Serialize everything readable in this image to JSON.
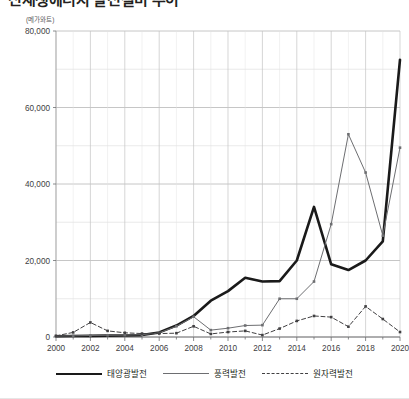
{
  "figure": {
    "title": "신재생에너지 발전설비 추이",
    "unit_label": "(메가와트)"
  },
  "legend": {
    "position": "bottom",
    "items": [
      {
        "label": "태양광발전",
        "style": "solid-thick",
        "color": "#1a1a1a"
      },
      {
        "label": "풍력발전",
        "style": "solid-thin",
        "color": "#6d6e71"
      },
      {
        "label": "원자력발전",
        "style": "dashed",
        "color": "#414042"
      }
    ]
  },
  "chart_data": {
    "type": "line",
    "title": "신재생에너지 발전설비 추이",
    "xlabel": "",
    "ylabel": "(메가와트)",
    "xlim": [
      2000,
      2020
    ],
    "ylim": [
      0,
      80000
    ],
    "ytick_labels": [
      "0",
      "20,000",
      "40,000",
      "60,000",
      "80,000"
    ],
    "ytick_values": [
      0,
      20000,
      40000,
      60000,
      80000
    ],
    "ygrid_step": 10000,
    "grid": true,
    "x": [
      2000,
      2001,
      2002,
      2003,
      2004,
      2005,
      2006,
      2007,
      2008,
      2009,
      2010,
      2011,
      2012,
      2013,
      2014,
      2015,
      2016,
      2017,
      2018,
      2019,
      2020
    ],
    "xtick_labels": [
      "2000",
      "2002",
      "2004",
      "2006",
      "2008",
      "2010",
      "2012",
      "2014",
      "2016",
      "2018",
      "2020"
    ],
    "xtick_values": [
      2000,
      2002,
      2004,
      2006,
      2008,
      2010,
      2012,
      2014,
      2016,
      2018,
      2020
    ],
    "series": [
      {
        "name": "태양광발전",
        "style": "solid-thick",
        "color": "#1a1a1a",
        "values": [
          200,
          250,
          300,
          350,
          400,
          500,
          1200,
          3000,
          5500,
          9500,
          12000,
          15500,
          14500,
          14600,
          20000,
          34000,
          19000,
          17500,
          20000,
          25000,
          72500
        ]
      },
      {
        "name": "풍력발전",
        "style": "solid-thin",
        "color": "#6d6e71",
        "values": [
          250,
          300,
          400,
          450,
          500,
          600,
          1100,
          2800,
          5300,
          1800,
          2300,
          3000,
          3100,
          10000,
          10000,
          14500,
          29500,
          53000,
          43000,
          26500,
          49500
        ]
      },
      {
        "name": "원자력발전",
        "style": "dashed",
        "color": "#414042",
        "values": [
          300,
          1200,
          3800,
          1600,
          1100,
          900,
          900,
          1000,
          2800,
          800,
          1300,
          1600,
          500,
          2200,
          4200,
          5500,
          5200,
          2700,
          8000,
          4700,
          1300
        ]
      }
    ]
  }
}
